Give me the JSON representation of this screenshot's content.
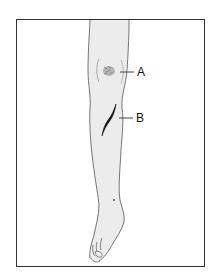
{
  "figure": {
    "colors": {
      "frame": "#333333",
      "skin_fill": "#ececec",
      "outline": "#555555",
      "lesion_a": "#888888",
      "lesion_b": "#111111",
      "label_text": "#111111"
    },
    "annotations": [
      {
        "id": "A",
        "label": "A",
        "target": "abrasion-on-knee"
      },
      {
        "id": "B",
        "label": "B",
        "target": "laceration-on-shin"
      }
    ]
  }
}
